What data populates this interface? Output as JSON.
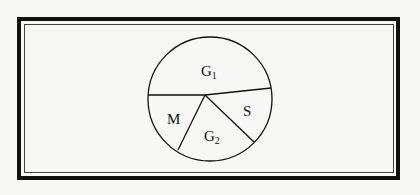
{
  "diagram": {
    "type": "pie-diagram",
    "sectors": [
      {
        "label": "G",
        "subscript": "1"
      },
      {
        "label": "M",
        "subscript": ""
      },
      {
        "label": "G",
        "subscript": "2"
      },
      {
        "label": "S",
        "subscript": ""
      }
    ],
    "colors": {
      "line": "#111111",
      "background": "#f7f7f5"
    }
  }
}
